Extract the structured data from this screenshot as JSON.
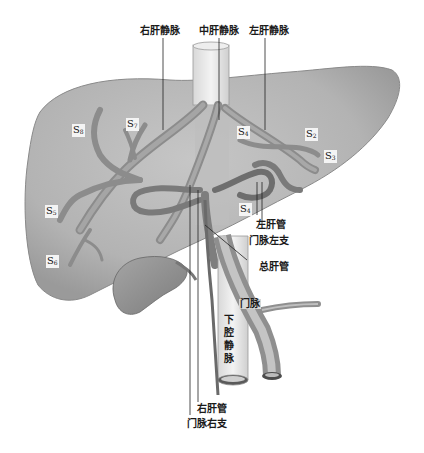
{
  "diagram": {
    "top_labels": {
      "right_hepatic_vein": "右肝静脉",
      "middle_hepatic_vein": "中肝静脉",
      "left_hepatic_vein": "左肝静脉"
    },
    "segments": {
      "s8": {
        "letter": "S",
        "num": "8"
      },
      "s7": {
        "letter": "S",
        "num": "7"
      },
      "s4": {
        "letter": "S",
        "num": "4"
      },
      "s2": {
        "letter": "S",
        "num": "2"
      },
      "s3": {
        "letter": "S",
        "num": "3"
      },
      "s5": {
        "letter": "S",
        "num": "5"
      },
      "s6": {
        "letter": "S",
        "num": "6"
      },
      "s4b": {
        "letter": "S",
        "num": "4"
      }
    },
    "right_labels": {
      "left_hepatic_duct": "左肝管",
      "left_portal_branch": "门脉左支",
      "common_hepatic_duct": "总肝管",
      "portal_vein": "门脉"
    },
    "ivc_label": [
      "下",
      "腔",
      "静",
      "脉"
    ],
    "bottom_labels": {
      "right_hepatic_duct": "右肝管",
      "right_portal_branch": "门脉右支"
    },
    "colors": {
      "liver_fill": "#b9b9b9",
      "liver_edge": "#8a8a8a",
      "vessel": "#8c8c8c",
      "vessel_dark": "#5e5e5e",
      "leader_line": "#222222"
    }
  }
}
